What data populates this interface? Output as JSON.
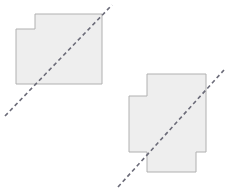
{
  "canvas": {
    "width": 229,
    "height": 193,
    "background_color": "#ffffff"
  },
  "style": {
    "shape_fill_color": "#eeeeee",
    "shape_stroke_color": "#b0b0b0",
    "shape_stroke_width": 1,
    "line_color": "#6b6b78",
    "line_width": 1.6,
    "line_dash_pattern": "4 3"
  },
  "chart_data": {
    "type": "diagram",
    "title": "",
    "shapes": [
      {
        "name": "shape-upper-left",
        "label": "Upper-left stepped polygon",
        "fill": "#eeeeee",
        "stroke": "#b0b0b0",
        "vertices": [
          [
            35,
            14
          ],
          [
            102,
            14
          ],
          [
            102,
            84
          ],
          [
            16,
            84
          ],
          [
            16,
            29
          ],
          [
            35,
            29
          ]
        ],
        "bbox": [
          16,
          14,
          86,
          70
        ]
      },
      {
        "name": "shape-lower-right",
        "label": "Lower-right stepped polygon",
        "fill": "#eeeeee",
        "stroke": "#b0b0b0",
        "vertices": [
          [
            147,
            74
          ],
          [
            206,
            74
          ],
          [
            206,
            152
          ],
          [
            196,
            152
          ],
          [
            196,
            172
          ],
          [
            147,
            172
          ],
          [
            147,
            152
          ],
          [
            129,
            152
          ],
          [
            129,
            96
          ],
          [
            147,
            96
          ]
        ],
        "bbox": [
          129,
          74,
          77,
          98
        ]
      }
    ],
    "lines": [
      {
        "name": "dashed-diagonal-upper-left",
        "label": "Dashed diagonal across upper-left polygon",
        "x1": 5,
        "y1": 116,
        "x2": 112,
        "y2": 5,
        "stroke": "#6b6b78",
        "dash": "4 3",
        "slope_direction": "lower-left to upper-right"
      },
      {
        "name": "dashed-diagonal-lower-right",
        "label": "Dashed diagonal across lower-right polygon",
        "x1": 118,
        "y1": 187,
        "x2": 224,
        "y2": 70,
        "stroke": "#6b6b78",
        "dash": "4 3",
        "slope_direction": "lower-left to upper-right"
      }
    ]
  }
}
